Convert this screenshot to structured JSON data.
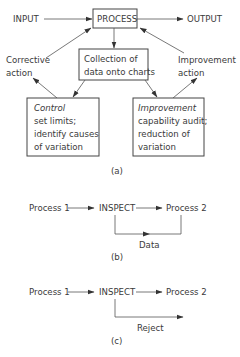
{
  "diagram_a": {
    "input_label": "INPUT",
    "process_label": "PROCESS",
    "output_label": "OUTPUT",
    "collection_line1": "Collection of",
    "collection_line2": "data onto charts",
    "corrective_line1": "Corrective",
    "corrective_line2": "action",
    "improvement_action_line1": "Improvement",
    "improvement_action_line2": "action",
    "control_box": {
      "title": "Control",
      "line1": "set limits;",
      "line2": "identify causes",
      "line3": "of variation"
    },
    "improvement_box": {
      "title": "Improvement",
      "line1": "capability audit;",
      "line2": "reduction of",
      "line3": "variation"
    },
    "caption": "(a)"
  },
  "diagram_b": {
    "process1_label": "Process 1",
    "inspect_label": "INSPECT",
    "process2_label": "Process 2",
    "loop_label": "Data",
    "caption": "(b)"
  },
  "diagram_c": {
    "process1_label": "Process 1",
    "inspect_label": "INSPECT",
    "process2_label": "Process 2",
    "branch_label": "Reject",
    "caption": "(c)"
  },
  "colors": {
    "text": "#3a3a3a",
    "line": "#555555",
    "background": "#ffffff"
  }
}
